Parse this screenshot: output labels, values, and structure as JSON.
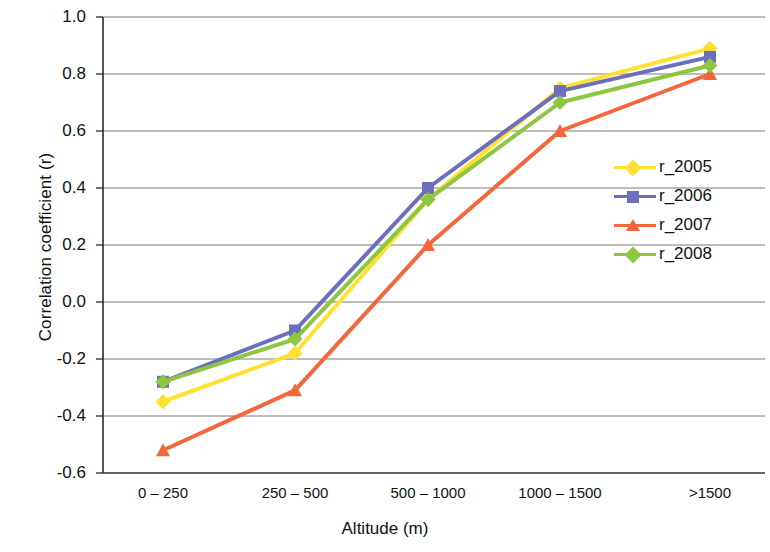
{
  "chart_data": {
    "type": "line",
    "title": "",
    "xlabel": "Altitude  (m)",
    "ylabel": "Correlation coefficient (r)",
    "categories": [
      "0 – 250",
      "250 – 500",
      "500 – 1000",
      "1000 – 1500",
      ">1500"
    ],
    "ylim": [
      -0.6,
      1.0
    ],
    "yticks": [
      "1.0",
      "0.8",
      "0.6",
      "0.4",
      "0.2",
      "0.0",
      "-0.2",
      "-0.4",
      "-0.6"
    ],
    "ytick_values": [
      1.0,
      0.8,
      0.6,
      0.4,
      0.2,
      0.0,
      -0.2,
      -0.4,
      -0.6
    ],
    "grid": true,
    "legend_position": "right-middle",
    "series": [
      {
        "name": "r_2005",
        "color": "#FFE033",
        "marker": "diamond",
        "values": [
          -0.35,
          -0.18,
          0.36,
          0.75,
          0.89
        ]
      },
      {
        "name": "r_2006",
        "color": "#6B6FBE",
        "marker": "square",
        "values": [
          -0.28,
          -0.1,
          0.4,
          0.74,
          0.86
        ]
      },
      {
        "name": "r_2007",
        "color": "#F4663C",
        "marker": "triangle",
        "values": [
          -0.52,
          -0.31,
          0.2,
          0.6,
          0.8
        ]
      },
      {
        "name": "r_2008",
        "color": "#8DC63F",
        "marker": "diamond",
        "values": [
          -0.28,
          -0.13,
          0.36,
          0.7,
          0.83
        ]
      }
    ]
  }
}
